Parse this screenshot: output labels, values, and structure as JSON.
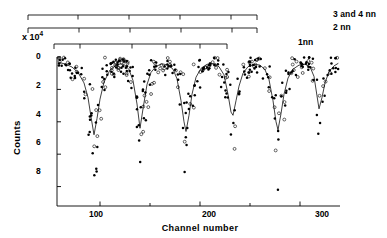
{
  "figure": {
    "background": "#ffffff",
    "ink_color": "#000000",
    "width": 387,
    "height": 238
  },
  "annotations": {
    "brackets": [
      {
        "name": "3 and 4 nn",
        "label": "3 and 4 nn",
        "start_channel": 28,
        "end_channel": 257,
        "tick_channels": [
          28,
          78,
          129,
          180,
          231,
          257
        ],
        "row": 0
      },
      {
        "name": "2 nn",
        "label": "2 nn",
        "start_channel": 28,
        "end_channel": 257,
        "tick_channels": [
          28,
          79,
          130,
          181,
          232,
          257
        ],
        "row": 1
      },
      {
        "name": "1 nn",
        "label": "1nn",
        "start_channel": 54,
        "end_channel": 227,
        "tick_channels": [
          54,
          80,
          132,
          166,
          200,
          227
        ],
        "row": 2
      }
    ]
  },
  "chart_data": {
    "type": "scatter",
    "title": "",
    "subtitle": "",
    "xlabel": "Channel  number",
    "ylabel": "Counts",
    "y_multiplier_label": "x 10",
    "y_multiplier_exponent": "4",
    "xlim": [
      57,
      340
    ],
    "ylim": [
      -9.2,
      0.35
    ],
    "y_inverted": true,
    "grid": false,
    "legend": null,
    "xticks_major": [
      100,
      200,
      300
    ],
    "xticks_minor": [
      150,
      250
    ],
    "xtick_labels": [
      "100",
      "200",
      "300"
    ],
    "yticks": [
      0,
      2,
      4,
      6,
      8
    ],
    "ytick_labels": [
      "0",
      "2",
      "4",
      "6",
      "8"
    ],
    "series": [
      {
        "name": "fitted curve",
        "style": "line",
        "marker": "none",
        "color": "#000000",
        "description": "Smooth fit with five deep absorption-like dips",
        "dip_channels": [
          94,
          140,
          186,
          232,
          277,
          318
        ],
        "dip_depths": [
          4.8,
          4.4,
          4.6,
          3.6,
          4.5,
          3.2
        ],
        "baseline": 0.25,
        "x": [
          60,
          66,
          72,
          78,
          84,
          88,
          91,
          94,
          97,
          100,
          104,
          110,
          116,
          121,
          125,
          129,
          133,
          137,
          140,
          143,
          147,
          151,
          156,
          162,
          168,
          173,
          177,
          181,
          184,
          186,
          189,
          192,
          196,
          201,
          207,
          213,
          219,
          224,
          228,
          231,
          233,
          236,
          239,
          243,
          248,
          254,
          260,
          265,
          269,
          273,
          276,
          278,
          281,
          284,
          288,
          293,
          299,
          305,
          310,
          314,
          317,
          319,
          322,
          325,
          329,
          334,
          338
        ],
        "y": [
          0.35,
          0.45,
          0.62,
          0.95,
          1.6,
          2.5,
          3.7,
          4.8,
          3.8,
          2.6,
          1.55,
          0.8,
          0.5,
          0.42,
          0.5,
          0.78,
          1.45,
          2.9,
          4.4,
          3.2,
          1.7,
          0.95,
          0.58,
          0.42,
          0.5,
          0.75,
          1.35,
          2.7,
          4.0,
          4.6,
          3.6,
          2.3,
          1.25,
          0.7,
          0.45,
          0.42,
          0.6,
          1.1,
          2.3,
          3.4,
          3.6,
          2.7,
          1.8,
          1.0,
          0.6,
          0.45,
          0.5,
          0.78,
          1.4,
          2.7,
          4.0,
          4.5,
          3.5,
          2.3,
          1.3,
          0.75,
          0.5,
          0.45,
          0.6,
          1.2,
          2.4,
          3.2,
          2.5,
          1.6,
          0.9,
          0.55,
          0.4
        ]
      },
      {
        "name": "open circles",
        "style": "markers",
        "marker": "open-circle",
        "color": "#000000",
        "point_count": 118
      },
      {
        "name": "filled circles",
        "style": "markers",
        "marker": "filled-circle",
        "color": "#000000",
        "point_count": 246
      }
    ]
  }
}
